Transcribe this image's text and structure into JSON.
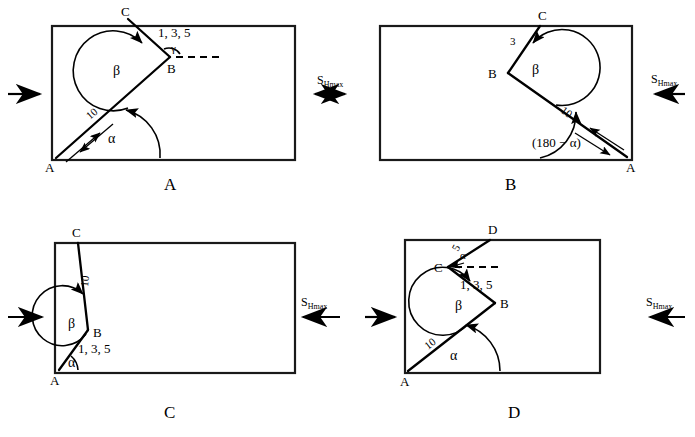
{
  "figure": {
    "stress_label": "S",
    "stress_subscript": "Hmax",
    "colors": {
      "line": "#000000",
      "rect": "#1a1a1a",
      "background": "#ffffff"
    }
  },
  "panels": [
    {
      "id": "A",
      "caption": "A",
      "points": [
        "A",
        "B",
        "C"
      ],
      "angles": [
        "α",
        "β",
        "γ"
      ],
      "segment_labels": {
        "ab": "10",
        "bc": "1, 3, 5"
      },
      "has_dashed_reference": true
    },
    {
      "id": "B",
      "caption": "B",
      "points": [
        "A",
        "B",
        "C"
      ],
      "angles": [
        "(180 − α)",
        "β"
      ],
      "segment_labels": {
        "ab": "10",
        "bc": "3"
      },
      "has_dashed_reference": false
    },
    {
      "id": "C",
      "caption": "C",
      "points": [
        "A",
        "B",
        "C"
      ],
      "angles": [
        "α",
        "β"
      ],
      "segment_labels": {
        "ab": "1, 3, 5",
        "bc": "10"
      },
      "has_dashed_reference": false
    },
    {
      "id": "D",
      "caption": "D",
      "points": [
        "A",
        "B",
        "C",
        "D"
      ],
      "angles": [
        "α",
        "β",
        "α"
      ],
      "segment_labels": {
        "ab": "10",
        "bc": "1, 3, 5",
        "cd": "5"
      },
      "has_dashed_reference": true
    }
  ],
  "stress_arrows": [
    {
      "name": "panel-a-left",
      "direction": "right",
      "label": ""
    },
    {
      "name": "between-a-b",
      "direction": "both",
      "label": "S",
      "sub": "Hmax"
    },
    {
      "name": "panel-b-right",
      "direction": "left",
      "label": "S",
      "sub": "Hmax"
    },
    {
      "name": "panel-c-left",
      "direction": "right",
      "label": ""
    },
    {
      "name": "panel-c-right",
      "direction": "left",
      "label": "S",
      "sub": "Hmax"
    },
    {
      "name": "panel-d-left",
      "direction": "right",
      "label": ""
    },
    {
      "name": "panel-d-right",
      "direction": "left",
      "label": "S",
      "sub": "Hmax"
    }
  ]
}
